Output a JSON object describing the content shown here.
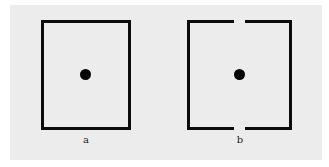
{
  "figure": {
    "panels": [
      {
        "id": "a",
        "label": "a",
        "shape": "closed-rectangle",
        "has_center_dot": true
      },
      {
        "id": "b",
        "label": "b",
        "shape": "rectangle-with-top-and-bottom-gaps",
        "has_center_dot": true
      }
    ],
    "colors": {
      "background": "#ececec",
      "stroke": "#0b0b0b"
    }
  }
}
